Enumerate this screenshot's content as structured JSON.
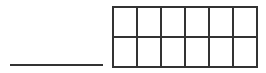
{
  "answer_line": {
    "value": ""
  },
  "grid": {
    "rows": 2,
    "cols": 6,
    "cells": [
      [
        "",
        "",
        "",
        "",
        "",
        ""
      ],
      [
        "",
        "",
        "",
        "",
        "",
        ""
      ]
    ],
    "line_color": "#333333"
  }
}
